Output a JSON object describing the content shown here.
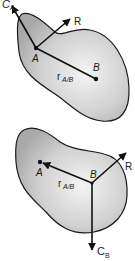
{
  "figure_top": {
    "points": {
      "A": "A",
      "B": "B"
    },
    "vectors": {
      "couple": {
        "main": "C",
        "sub": "A"
      },
      "resultant": "R",
      "position": {
        "main": "r",
        "sub": "A/B"
      }
    }
  },
  "figure_bottom": {
    "points": {
      "A": "A",
      "B": "B"
    },
    "vectors": {
      "couple": {
        "main": "C",
        "sub": "B"
      },
      "resultant": "R",
      "position": {
        "main": "r",
        "sub": "A/B"
      }
    }
  },
  "colors": {
    "body_fill_light": "#f4f4f4",
    "body_fill_dark": "#a9a9a9",
    "outline": "#1a1a1a",
    "vector": "#111111"
  }
}
